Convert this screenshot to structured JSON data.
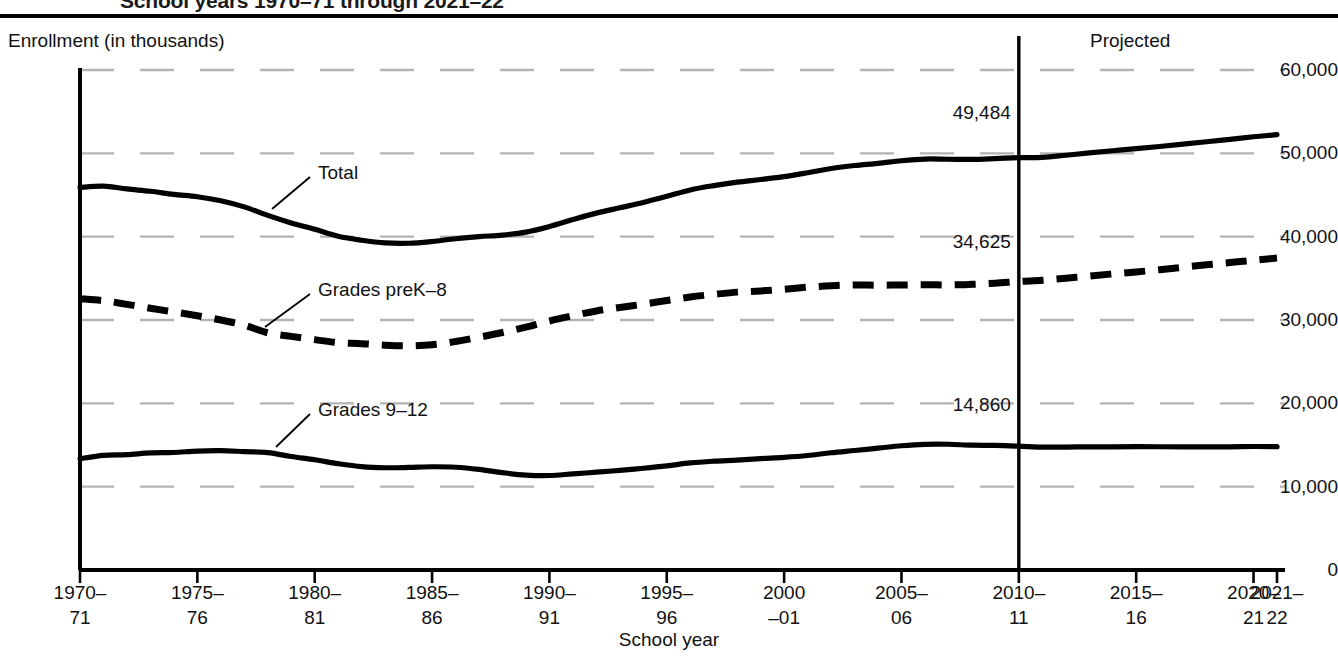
{
  "figure": {
    "title": "School years 1970–71 through 2021–22",
    "y_axis_title": "Enrollment (in thousands)",
    "x_axis_title": "School year",
    "projected_label": "Projected"
  },
  "chart_data": {
    "type": "line",
    "title": "School years 1970–71 through 2021–22",
    "xlabel": "School year",
    "ylabel": "Enrollment (in thousands)",
    "ylim": [
      0,
      60000
    ],
    "xlim": [
      1970,
      2021
    ],
    "grid": true,
    "grid_style": "dashed-light-gray",
    "legend": "inline-annotations",
    "ytick_labels": [
      "0",
      "10,000",
      "20,000",
      "30,000",
      "40,000",
      "50,000",
      "60,000"
    ],
    "ytick_values": [
      0,
      10000,
      20000,
      30000,
      40000,
      50000,
      60000
    ],
    "xtick_labels": [
      "1970–\n71",
      "1975–\n76",
      "1980–\n81",
      "1985–\n86",
      "1990–\n91",
      "1995–\n96",
      "2000\n–01",
      "2005–\n06",
      "2010–\n11",
      "2015–\n16",
      "2020–\n21",
      "2021–\n22"
    ],
    "xtick_lines": [
      [
        "1970–",
        "71"
      ],
      [
        "1975–",
        "76"
      ],
      [
        "1980–",
        "81"
      ],
      [
        "1985–",
        "86"
      ],
      [
        "1990–",
        "91"
      ],
      [
        "1995–",
        "96"
      ],
      [
        "2000",
        "–01"
      ],
      [
        "2005–",
        "06"
      ],
      [
        "2010–",
        "11"
      ],
      [
        "2015–",
        "16"
      ],
      [
        "2020–",
        "21"
      ],
      [
        "2021–",
        "22"
      ]
    ],
    "xtick_values": [
      1970,
      1975,
      1980,
      1985,
      1990,
      1995,
      2000,
      2005,
      2010,
      2015,
      2020,
      2021
    ],
    "projection_start_year": 2010,
    "x": [
      1970,
      1971,
      1972,
      1973,
      1974,
      1975,
      1976,
      1977,
      1978,
      1979,
      1980,
      1981,
      1982,
      1983,
      1984,
      1985,
      1986,
      1987,
      1988,
      1989,
      1990,
      1991,
      1992,
      1993,
      1994,
      1995,
      1996,
      1997,
      1998,
      1999,
      2000,
      2001,
      2002,
      2003,
      2004,
      2005,
      2006,
      2007,
      2008,
      2009,
      2010,
      2011,
      2012,
      2013,
      2014,
      2015,
      2016,
      2017,
      2018,
      2019,
      2020,
      2021
    ],
    "series": [
      {
        "name": "Total",
        "style": "solid",
        "color": "#000000",
        "end_value": 49484,
        "end_value_label": "49,484",
        "values": [
          45909,
          46071,
          45726,
          45445,
          45073,
          44791,
          44317,
          43577,
          42551,
          41651,
          40877,
          40044,
          39566,
          39252,
          39208,
          39422,
          39753,
          40008,
          40189,
          40543,
          41217,
          42047,
          42823,
          43465,
          44111,
          44840,
          45611,
          46127,
          46539,
          46857,
          47204,
          47672,
          48183,
          48540,
          48795,
          49113,
          49316,
          49293,
          49266,
          49361,
          49484,
          49522,
          49771,
          50045,
          50312,
          50560,
          50823,
          51111,
          51394,
          51677,
          51985,
          52241
        ]
      },
      {
        "name": "Grades preK–8",
        "style": "dashed",
        "color": "#000000",
        "end_value": 34625,
        "end_value_label": "34,625",
        "values": [
          32558,
          32318,
          31879,
          31401,
          30971,
          30515,
          29997,
          29375,
          28463,
          28034,
          27647,
          27280,
          27161,
          26981,
          26905,
          27034,
          27420,
          27933,
          28501,
          29152,
          29878,
          30506,
          31088,
          31504,
          31898,
          32341,
          32764,
          33073,
          33344,
          33486,
          33686,
          33936,
          34114,
          34201,
          34178,
          34204,
          34235,
          34204,
          34286,
          34409,
          34625,
          34773,
          35018,
          35269,
          35534,
          35766,
          36036,
          36334,
          36623,
          36900,
          37167,
          37436
        ]
      },
      {
        "name": "Grades 9–12",
        "style": "solid",
        "color": "#000000",
        "end_value": 14860,
        "end_value_label": "14,860",
        "values": [
          13351,
          13753,
          13847,
          14044,
          14103,
          14276,
          14320,
          14203,
          14088,
          13616,
          13231,
          12764,
          12405,
          12271,
          12304,
          12388,
          12333,
          12076,
          11687,
          11390,
          11338,
          11541,
          11735,
          11961,
          12213,
          12500,
          12847,
          13054,
          13195,
          13371,
          13517,
          13736,
          14069,
          14339,
          14618,
          14909,
          15081,
          15087,
          14980,
          14952,
          14860,
          14749,
          14753,
          14776,
          14778,
          14794,
          14787,
          14777,
          14771,
          14777,
          14818,
          14805
        ]
      }
    ],
    "annotations": [
      {
        "text": "Total",
        "kind": "series-callout"
      },
      {
        "text": "Grades preK–8",
        "kind": "series-callout"
      },
      {
        "text": "Grades 9–12",
        "kind": "series-callout"
      },
      {
        "text": "49,484",
        "kind": "value-label"
      },
      {
        "text": "34,625",
        "kind": "value-label"
      },
      {
        "text": "14,860",
        "kind": "value-label"
      },
      {
        "text": "Projected",
        "kind": "region-label"
      }
    ]
  },
  "colors": {
    "line": "#000000",
    "grid": "#b3b3b3",
    "axis": "#000000",
    "background": "#ffffff"
  }
}
